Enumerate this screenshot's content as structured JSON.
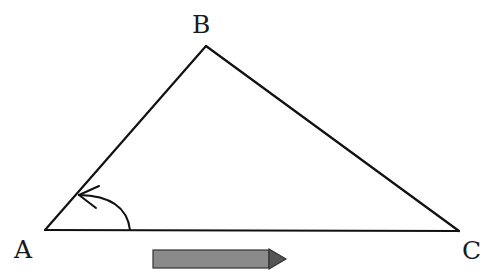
{
  "diagram": {
    "type": "triangle",
    "vertices": [
      {
        "label": "A",
        "x": 45,
        "y": 230,
        "label_x": 14,
        "label_y": 258
      },
      {
        "label": "B",
        "x": 206,
        "y": 46,
        "label_x": 192,
        "label_y": 33
      },
      {
        "label": "C",
        "x": 459,
        "y": 231,
        "label_x": 462,
        "label_y": 259
      }
    ],
    "angle_marker": {
      "at": "A",
      "direction": "counterclockwise",
      "description": "curved arrow from side AC to side AB"
    },
    "direction_arrow": {
      "direction": "right",
      "fill": "#8a8a8a",
      "stroke": "#333333"
    },
    "colors": {
      "line": "#111111",
      "arrow_fill": "#8a8a8a"
    }
  }
}
